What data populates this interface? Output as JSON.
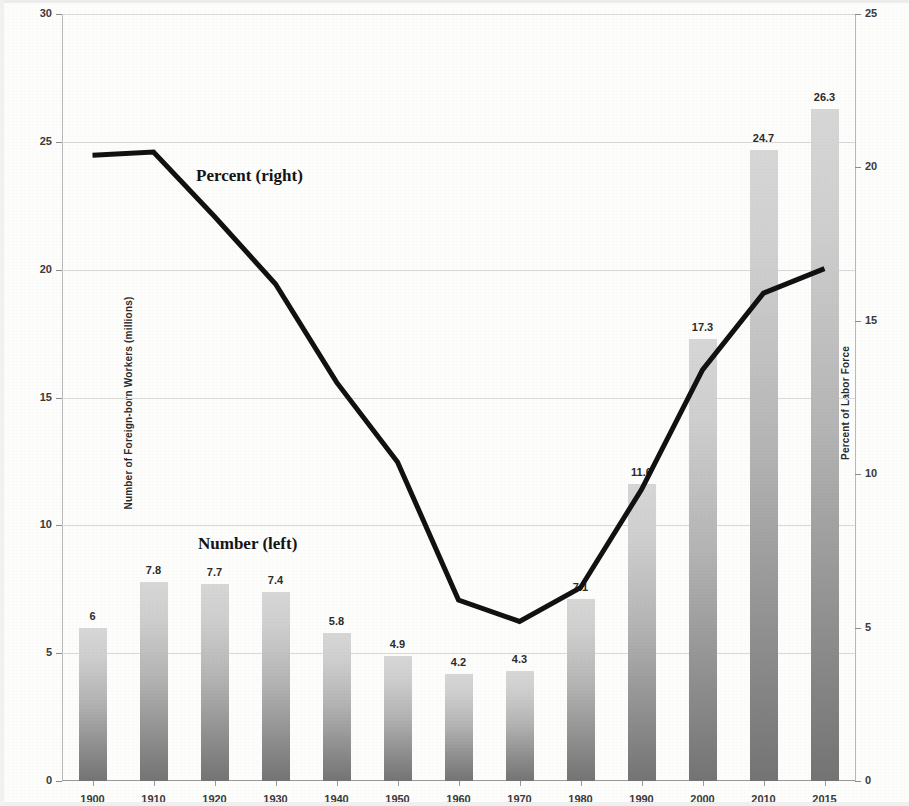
{
  "chart_data": {
    "type": "bar",
    "title": "",
    "subtitle": "",
    "categories": [
      "1900",
      "1910",
      "1920",
      "1930",
      "1940",
      "1950",
      "1960",
      "1970",
      "1980",
      "1990",
      "2000",
      "2010",
      "2015"
    ],
    "series": [
      {
        "name": "Number (left)",
        "type": "bar",
        "axis": "left",
        "values": [
          6,
          7.8,
          7.7,
          7.4,
          5.8,
          4.9,
          4.2,
          4.3,
          7.1,
          11.6,
          17.3,
          24.7,
          26.3
        ],
        "labels": [
          "6",
          "7.8",
          "7.7",
          "7.4",
          "5.8",
          "4.9",
          "4.2",
          "4.3",
          "7.1",
          "11.6",
          "17.3",
          "24.7",
          "26.3"
        ]
      },
      {
        "name": "Percent (right)",
        "type": "line",
        "axis": "right",
        "values": [
          20.4,
          20.5,
          18.4,
          16.2,
          13.0,
          10.4,
          5.9,
          5.2,
          6.3,
          9.5,
          13.4,
          15.9,
          16.7
        ]
      }
    ],
    "xlabel": "",
    "ylabel": "Number of Foreign-born Workers (millions)",
    "y2label": "Percent of Labor Force",
    "ylim": [
      0,
      30
    ],
    "y2lim": [
      0,
      25
    ],
    "yticks": [
      0,
      5,
      10,
      15,
      20,
      25,
      30
    ],
    "y2ticks": [
      0,
      5,
      10,
      15,
      20,
      25
    ],
    "grid": true,
    "legend": "inline-annotations",
    "colors": {
      "bar_top": "#d7d7d7",
      "bar_bottom": "#747474",
      "line": "#111111",
      "gridline": "#d9d9d9",
      "axis": "#9a9a9a",
      "text": "#2b2b2b",
      "background": "#fdfdfc"
    },
    "annotations": [
      {
        "text": "Percent (right)",
        "x": 196,
        "y": 166
      },
      {
        "text": "Number (left)",
        "x": 198,
        "y": 534
      }
    ]
  },
  "axes": {
    "left_title": "Number of Foreign-born Workers (millions)",
    "right_title": "Percent of Labor Force",
    "left_ticks": [
      "0",
      "5",
      "10",
      "15",
      "20",
      "25",
      "30"
    ],
    "right_ticks": [
      "0",
      "5",
      "10",
      "15",
      "20",
      "25"
    ],
    "x_ticks": [
      "1900",
      "1910",
      "1920",
      "1930",
      "1940",
      "1950",
      "1960",
      "1970",
      "1980",
      "1990",
      "2000",
      "2010",
      "2015"
    ]
  },
  "annotations": {
    "percent_note": "Percent (right)",
    "number_note": "Number (left)"
  }
}
